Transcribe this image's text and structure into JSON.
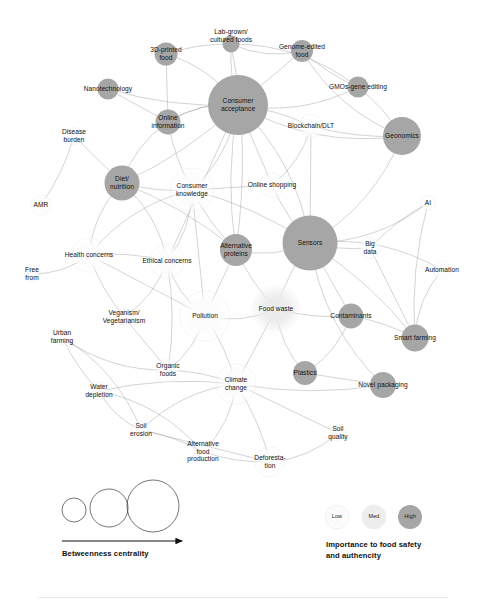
{
  "figure": {
    "type": "network-graph",
    "title": "",
    "background": "#ffffff",
    "width": 486,
    "height": 603
  },
  "palette": {
    "edge": "#9a9a9a",
    "node_low": "#fbfbfb",
    "node_med": "#ededed",
    "node_high": "#a6a6a6",
    "node_stroke": "#e2e2e2",
    "text": "#111111",
    "axis": "#111111"
  },
  "chart_data": {
    "type": "network",
    "encodings": {
      "node_size": "Betweenness centrality",
      "node_color": "Importance to food safety and authencity"
    },
    "nodes": [
      {
        "id": "3d-printed-food",
        "label": "3D-printed\nfood",
        "x": 166,
        "y": 54,
        "r": 11.5,
        "shade": "high",
        "label_dx": 0,
        "label_dy": 0
      },
      {
        "id": "lab-grown-cultured",
        "label": "Lab-grown/\ncultured foods",
        "x": 231,
        "y": 44,
        "r": 8.5,
        "shade": "high",
        "label_dx": 0,
        "label_dy": -8
      },
      {
        "id": "genome-edited-food",
        "label": "Genome-edited\nfood",
        "x": 302,
        "y": 51,
        "r": 11.0,
        "shade": "high",
        "label_dx": 0,
        "label_dy": 0
      },
      {
        "id": "nanotechnology",
        "label": "Nanotechnology",
        "x": 108,
        "y": 89,
        "r": 10.5,
        "shade": "high",
        "label_dx": 0,
        "label_dy": 0
      },
      {
        "id": "gmos-gene-editing",
        "label": "GMOs-gene editing",
        "x": 358,
        "y": 87,
        "r": 10.5,
        "shade": "high",
        "label_dx": 0,
        "label_dy": 0
      },
      {
        "id": "consumer-acceptance",
        "label": "Consumer\nacceptance",
        "x": 238,
        "y": 105,
        "r": 30.0,
        "shade": "high",
        "label_dx": 0,
        "label_dy": 0
      },
      {
        "id": "online-information",
        "label": "Online\ninformation",
        "x": 168,
        "y": 122,
        "r": 12.5,
        "shade": "high",
        "label_dx": 0,
        "label_dy": 0
      },
      {
        "id": "geonomics",
        "label": "Geonomics",
        "x": 402,
        "y": 136,
        "r": 19.0,
        "shade": "high",
        "label_dx": 0,
        "label_dy": 0
      },
      {
        "id": "blockchain-dlt",
        "label": "Blockchain/DLT",
        "x": 311,
        "y": 126,
        "r": 12.0,
        "shade": "low",
        "label_dx": 0,
        "label_dy": 0
      },
      {
        "id": "disease-burden",
        "label": "Disease\nburden",
        "x": 74,
        "y": 136,
        "r": 8.5,
        "shade": "low",
        "label_dx": 0,
        "label_dy": 0
      },
      {
        "id": "diet-nutrition",
        "label": "Diet/\nnutrition",
        "x": 122,
        "y": 183,
        "r": 17.5,
        "shade": "high",
        "label_dx": 0,
        "label_dy": 0
      },
      {
        "id": "consumer-knowledge",
        "label": "Consumer\nknowledge",
        "x": 192,
        "y": 190,
        "r": 22.0,
        "shade": "low",
        "label_dx": 0,
        "label_dy": 0
      },
      {
        "id": "online-shopping",
        "label": "Online shopping",
        "x": 272,
        "y": 185,
        "r": 12.0,
        "shade": "low",
        "label_dx": 0,
        "label_dy": 0
      },
      {
        "id": "amr",
        "label": "AMR",
        "x": 41,
        "y": 205,
        "r": 10.0,
        "shade": "low",
        "label_dx": 0,
        "label_dy": 0
      },
      {
        "id": "ai",
        "label": "AI",
        "x": 428,
        "y": 203,
        "r": 7.5,
        "shade": "low",
        "label_dx": 0,
        "label_dy": 0
      },
      {
        "id": "sensors",
        "label": "Sensors",
        "x": 310,
        "y": 243,
        "r": 27.5,
        "shade": "high",
        "label_dx": 0,
        "label_dy": 0
      },
      {
        "id": "alternative-proteins",
        "label": "Alternative\nproteins",
        "x": 236,
        "y": 250,
        "r": 16.0,
        "shade": "high",
        "label_dx": 0,
        "label_dy": 0
      },
      {
        "id": "health-concerns",
        "label": "Health concerns",
        "x": 89,
        "y": 255,
        "r": 17.0,
        "shade": "low",
        "label_dx": 0,
        "label_dy": 0
      },
      {
        "id": "ethical-concerns",
        "label": "Ethical concerns",
        "x": 167,
        "y": 261,
        "r": 17.0,
        "shade": "low",
        "label_dx": 0,
        "label_dy": 0
      },
      {
        "id": "big-data",
        "label": "Big\ndata",
        "x": 370,
        "y": 248,
        "r": 10.5,
        "shade": "low",
        "label_dx": 0,
        "label_dy": 0
      },
      {
        "id": "free-from",
        "label": "Free\nfrom",
        "x": 32,
        "y": 274,
        "r": 7.5,
        "shade": "low",
        "label_dx": 0,
        "label_dy": 0
      },
      {
        "id": "automation",
        "label": "Automation",
        "x": 442,
        "y": 270,
        "r": 9.0,
        "shade": "low",
        "label_dx": 0,
        "label_dy": 0
      },
      {
        "id": "pollution",
        "label": "Pollution",
        "x": 205,
        "y": 316,
        "r": 25.0,
        "shade": "low",
        "label_dx": 0,
        "label_dy": 0
      },
      {
        "id": "food-waste",
        "label": "Food waste",
        "x": 276,
        "y": 309,
        "r": 26.0,
        "shade": "med",
        "label_dx": 0,
        "label_dy": 0
      },
      {
        "id": "contaminants",
        "label": "Contaminants",
        "x": 351,
        "y": 316,
        "r": 12.5,
        "shade": "high",
        "label_dx": 0,
        "label_dy": 0
      },
      {
        "id": "veganism-vegetarianism",
        "label": "Veganism/\nVegetarianism",
        "x": 124,
        "y": 317,
        "r": 8.0,
        "shade": "low",
        "label_dx": 0,
        "label_dy": 0
      },
      {
        "id": "smart-farming",
        "label": "Smart farming",
        "x": 415,
        "y": 338,
        "r": 13.5,
        "shade": "high",
        "label_dx": 0,
        "label_dy": 0
      },
      {
        "id": "urban-farming",
        "label": "Urban\nfarming",
        "x": 62,
        "y": 337,
        "r": 8.0,
        "shade": "low",
        "label_dx": 0,
        "label_dy": 0
      },
      {
        "id": "organic-foods",
        "label": "Organic\nfoods",
        "x": 168,
        "y": 370,
        "r": 12.0,
        "shade": "low",
        "label_dx": 0,
        "label_dy": 0
      },
      {
        "id": "plastics",
        "label": "Plastics",
        "x": 305,
        "y": 373,
        "r": 12.0,
        "shade": "high",
        "label_dx": 0,
        "label_dy": 0
      },
      {
        "id": "climate-change",
        "label": "Climate\nchange",
        "x": 236,
        "y": 384,
        "r": 20.0,
        "shade": "low",
        "label_dx": 0,
        "label_dy": 0
      },
      {
        "id": "water-depletion",
        "label": "Water\ndepletion",
        "x": 99,
        "y": 391,
        "r": 9.0,
        "shade": "low",
        "label_dx": 0,
        "label_dy": 0
      },
      {
        "id": "novel-packaging",
        "label": "Novel packaging",
        "x": 383,
        "y": 385,
        "r": 13.0,
        "shade": "high",
        "label_dx": 0,
        "label_dy": 0
      },
      {
        "id": "soil-erosion",
        "label": "Soil\nerosion",
        "x": 141,
        "y": 430,
        "r": 9.5,
        "shade": "low",
        "label_dx": 0,
        "label_dy": 0
      },
      {
        "id": "soil-quality",
        "label": "Soil\nquality",
        "x": 338,
        "y": 433,
        "r": 8.0,
        "shade": "low",
        "label_dx": 0,
        "label_dy": 0
      },
      {
        "id": "alternative-food-prod",
        "label": "Alternative\nfood\nproduction",
        "x": 203,
        "y": 452,
        "r": 9.0,
        "shade": "low",
        "label_dx": 0,
        "label_dy": 0
      },
      {
        "id": "deforestation",
        "label": "Deforesta-\ntion",
        "x": 270,
        "y": 462,
        "r": 15.0,
        "shade": "low",
        "label_dx": 0,
        "label_dy": 0
      }
    ],
    "edges": [
      [
        "3d-printed-food",
        "consumer-acceptance"
      ],
      [
        "3d-printed-food",
        "lab-grown-cultured"
      ],
      [
        "3d-printed-food",
        "online-information"
      ],
      [
        "lab-grown-cultured",
        "consumer-acceptance"
      ],
      [
        "lab-grown-cultured",
        "genome-edited-food"
      ],
      [
        "lab-grown-cultured",
        "gmos-gene-editing"
      ],
      [
        "lab-grown-cultured",
        "alternative-proteins"
      ],
      [
        "genome-edited-food",
        "consumer-acceptance"
      ],
      [
        "genome-edited-food",
        "gmos-gene-editing"
      ],
      [
        "genome-edited-food",
        "geonomics"
      ],
      [
        "gmos-gene-editing",
        "consumer-acceptance"
      ],
      [
        "gmos-gene-editing",
        "geonomics"
      ],
      [
        "nanotechnology",
        "online-information"
      ],
      [
        "nanotechnology",
        "consumer-acceptance"
      ],
      [
        "consumer-acceptance",
        "online-information"
      ],
      [
        "consumer-acceptance",
        "consumer-knowledge"
      ],
      [
        "consumer-acceptance",
        "blockchain-dlt"
      ],
      [
        "consumer-acceptance",
        "online-shopping"
      ],
      [
        "consumer-acceptance",
        "alternative-proteins"
      ],
      [
        "consumer-acceptance",
        "geonomics"
      ],
      [
        "consumer-acceptance",
        "sensors"
      ],
      [
        "consumer-acceptance",
        "diet-nutrition"
      ],
      [
        "consumer-acceptance",
        "ethical-concerns"
      ],
      [
        "online-information",
        "consumer-knowledge"
      ],
      [
        "online-information",
        "diet-nutrition"
      ],
      [
        "online-information",
        "consumer-acceptance"
      ],
      [
        "disease-burden",
        "amr"
      ],
      [
        "disease-burden",
        "diet-nutrition"
      ],
      [
        "diet-nutrition",
        "consumer-knowledge"
      ],
      [
        "diet-nutrition",
        "health-concerns"
      ],
      [
        "diet-nutrition",
        "ethical-concerns"
      ],
      [
        "diet-nutrition",
        "alternative-proteins"
      ],
      [
        "consumer-knowledge",
        "online-shopping"
      ],
      [
        "consumer-knowledge",
        "alternative-proteins"
      ],
      [
        "consumer-knowledge",
        "health-concerns"
      ],
      [
        "consumer-knowledge",
        "ethical-concerns"
      ],
      [
        "consumer-knowledge",
        "sensors"
      ],
      [
        "consumer-knowledge",
        "pollution"
      ],
      [
        "online-shopping",
        "sensors"
      ],
      [
        "online-shopping",
        "blockchain-dlt"
      ],
      [
        "geonomics",
        "sensors"
      ],
      [
        "geonomics",
        "blockchain-dlt"
      ],
      [
        "blockchain-dlt",
        "sensors"
      ],
      [
        "sensors",
        "big-data"
      ],
      [
        "sensors",
        "ai"
      ],
      [
        "sensors",
        "automation"
      ],
      [
        "sensors",
        "smart-farming"
      ],
      [
        "sensors",
        "contaminants"
      ],
      [
        "sensors",
        "food-waste"
      ],
      [
        "sensors",
        "novel-packaging"
      ],
      [
        "sensors",
        "alternative-proteins"
      ],
      [
        "big-data",
        "ai"
      ],
      [
        "big-data",
        "smart-farming"
      ],
      [
        "ai",
        "smart-farming"
      ],
      [
        "automation",
        "smart-farming"
      ],
      [
        "health-concerns",
        "free-from"
      ],
      [
        "health-concerns",
        "ethical-concerns"
      ],
      [
        "health-concerns",
        "pollution"
      ],
      [
        "health-concerns",
        "veganism-vegetarianism"
      ],
      [
        "ethical-concerns",
        "pollution"
      ],
      [
        "ethical-concerns",
        "veganism-vegetarianism"
      ],
      [
        "ethical-concerns",
        "organic-foods"
      ],
      [
        "alternative-proteins",
        "pollution"
      ],
      [
        "alternative-proteins",
        "food-waste"
      ],
      [
        "pollution",
        "food-waste"
      ],
      [
        "pollution",
        "organic-foods"
      ],
      [
        "pollution",
        "climate-change"
      ],
      [
        "food-waste",
        "climate-change"
      ],
      [
        "food-waste",
        "contaminants"
      ],
      [
        "food-waste",
        "plastics"
      ],
      [
        "contaminants",
        "plastics"
      ],
      [
        "contaminants",
        "smart-farming"
      ],
      [
        "veganism-vegetarianism",
        "organic-foods"
      ],
      [
        "urban-farming",
        "water-depletion"
      ],
      [
        "urban-farming",
        "organic-foods"
      ],
      [
        "urban-farming",
        "soil-erosion"
      ],
      [
        "organic-foods",
        "climate-change"
      ],
      [
        "plastics",
        "novel-packaging"
      ],
      [
        "climate-change",
        "water-depletion"
      ],
      [
        "climate-change",
        "soil-erosion"
      ],
      [
        "climate-change",
        "alternative-food-prod"
      ],
      [
        "climate-change",
        "deforestation"
      ],
      [
        "climate-change",
        "soil-quality"
      ],
      [
        "climate-change",
        "novel-packaging"
      ],
      [
        "water-depletion",
        "soil-erosion"
      ],
      [
        "water-depletion",
        "alternative-food-prod"
      ],
      [
        "soil-erosion",
        "alternative-food-prod"
      ],
      [
        "soil-erosion",
        "deforestation"
      ],
      [
        "alternative-food-prod",
        "deforestation"
      ],
      [
        "deforestation",
        "soil-quality"
      ]
    ]
  },
  "legend_size": {
    "caption": "Betweenness centrality",
    "circles": [
      {
        "label": "small",
        "cx": 74,
        "cy": 510,
        "r": 12
      },
      {
        "label": "medium",
        "cx": 109,
        "cy": 508,
        "r": 19
      },
      {
        "label": "large",
        "cx": 153,
        "cy": 506,
        "r": 26
      }
    ],
    "arrow": {
      "x1": 62,
      "x2": 182,
      "y": 541
    }
  },
  "legend_color": {
    "caption_line1": "Importance to food safety",
    "caption_line2": "and authencity",
    "items": [
      {
        "label": "Low",
        "cx": 337,
        "cy": 517,
        "r": 12,
        "shade": "low"
      },
      {
        "label": "Med",
        "cx": 374,
        "cy": 517,
        "r": 12,
        "shade": "med"
      },
      {
        "label": "High",
        "cx": 410,
        "cy": 517,
        "r": 12,
        "shade": "high"
      }
    ]
  }
}
